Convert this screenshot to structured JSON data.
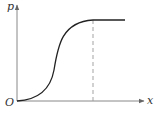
{
  "diagram": {
    "title": "",
    "y_axis_label": "p",
    "x_axis_label": "x",
    "origin_label": "O",
    "curve_type": "sigmoid (S-shaped) rising to a plateau",
    "marker": "dashed vertical line at the point where the curve reaches its plateau",
    "colors": {
      "axis": "#888888",
      "curve": "#222222",
      "dashed": "#999999",
      "text": "#333333"
    }
  }
}
